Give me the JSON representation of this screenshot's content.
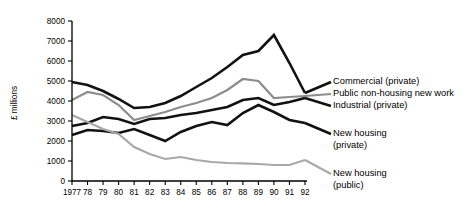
{
  "chart_data": {
    "type": "line",
    "title": "",
    "xlabel": "",
    "ylabel": "£ millions",
    "x": [
      1977,
      1978,
      1979,
      1980,
      1981,
      1982,
      1983,
      1984,
      1985,
      1986,
      1987,
      1988,
      1989,
      1990,
      1991,
      1992
    ],
    "xtick_labels": [
      "1977",
      "78",
      "79",
      "80",
      "81",
      "82",
      "83",
      "84",
      "85",
      "86",
      "87",
      "88",
      "89",
      "90",
      "91",
      "92"
    ],
    "ytick_labels": [
      "0",
      "1000",
      "2000",
      "3000",
      "4000",
      "5000",
      "6000",
      "7000",
      "8000"
    ],
    "ytick_values": [
      0,
      1000,
      2000,
      3000,
      4000,
      5000,
      6000,
      7000,
      8000
    ],
    "ylim": [
      0,
      8000
    ],
    "xlim": [
      1977,
      1992
    ],
    "grid": false,
    "legend_position": "right-inline",
    "series": [
      {
        "name": "Commercial (private)",
        "color": "#121212",
        "width": 2.6,
        "values": [
          4950,
          4800,
          4500,
          4100,
          3650,
          3700,
          3900,
          4250,
          4700,
          5150,
          5700,
          6300,
          6500,
          7300,
          5900,
          4400
        ]
      },
      {
        "name": "Public non-housing new work",
        "color": "#8c8c8c",
        "width": 2.2,
        "values": [
          4050,
          4450,
          4300,
          3800,
          3050,
          3250,
          3450,
          3700,
          3900,
          4150,
          4550,
          5100,
          5000,
          4150,
          4200,
          4250
        ]
      },
      {
        "name": "Industrial (private)",
        "color": "#121212",
        "width": 2.6,
        "values": [
          2750,
          2900,
          3200,
          3100,
          2850,
          3100,
          3150,
          3300,
          3400,
          3550,
          3700,
          4050,
          4150,
          3800,
          3950,
          4150
        ]
      },
      {
        "name": "New housing (private)",
        "color": "#121212",
        "width": 2.6,
        "values": [
          2300,
          2550,
          2500,
          2400,
          2600,
          2300,
          2000,
          2450,
          2750,
          2950,
          2800,
          3400,
          3800,
          3450,
          3050,
          2900
        ]
      },
      {
        "name": "New housing (public)",
        "color": "#a8a8a8",
        "width": 2.2,
        "values": [
          3300,
          2950,
          2600,
          2350,
          1700,
          1350,
          1100,
          1200,
          1050,
          950,
          900,
          880,
          850,
          800,
          800,
          1050
        ]
      }
    ],
    "legend_entries": [
      {
        "label": "Commercial (private)",
        "color": "#121212"
      },
      {
        "label": "Public non-housing new work",
        "color": "#121212"
      },
      {
        "label": "Industrial (private)",
        "color": "#121212"
      },
      {
        "label": "New housing",
        "label2": "(private)",
        "color": "#8c8c8c"
      },
      {
        "label": "New housing",
        "label2": "(public)",
        "color": "#a8a8a8"
      }
    ]
  },
  "legend": {
    "commercial_private": "Commercial (private)",
    "public_non_housing": "Public non-housing new work",
    "industrial_private": "Industrial (private)",
    "new_housing_private_l1": "New housing",
    "new_housing_private_l2": "(private)",
    "new_housing_public_l1": "New housing",
    "new_housing_public_l2": "(public)"
  },
  "axis": {
    "y_title": "£ millions"
  }
}
